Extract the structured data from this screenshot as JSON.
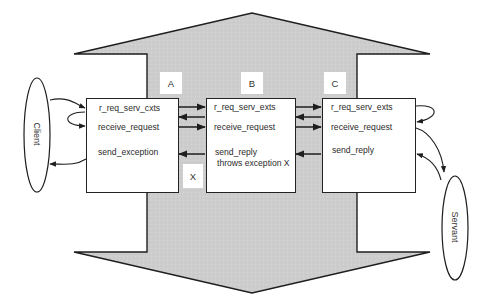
{
  "diagram": {
    "colors": {
      "arrow_fill": "#cccccc",
      "stroke": "#1e1e1e",
      "box_fill": "#ffffff",
      "text": "#2a2a2a"
    },
    "actors": {
      "client": {
        "label": "Client"
      },
      "servant": {
        "label": "Servant"
      }
    },
    "boxes": [
      {
        "id": "A",
        "tag": "A",
        "lines": [
          "r_req_serv_cxts",
          "receive_request",
          "send_exception"
        ]
      },
      {
        "id": "B",
        "tag": "B",
        "lines": [
          "r_req_serv_exts",
          "receive_request",
          "send_reply",
          "throws exception X"
        ]
      },
      {
        "id": "C",
        "tag": "C",
        "lines": [
          "r_req_serv_exts",
          "receive_request",
          "send_reply"
        ]
      }
    ],
    "exception_tag": "X"
  }
}
